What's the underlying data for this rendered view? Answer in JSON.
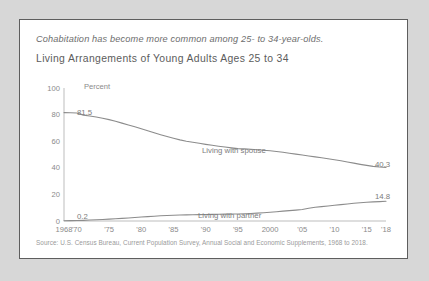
{
  "card": {
    "headline": "Cohabitation has become more common among 25- to 34-year-olds.",
    "title": "Living Arrangements of Young Adults Ages 25 to 34",
    "source": "Source: U.S. Census Bureau, Current Population Survey, Annual Social and Economic Supplements, 1968 to 2018."
  },
  "chart_data": {
    "type": "line",
    "title": "Living Arrangements of Young Adults Ages 25 to 34",
    "subtitle": "Cohabitation has become more common among 25- to 34-year-olds.",
    "xlabel": "",
    "ylabel": "Percent",
    "ylim": [
      0,
      100
    ],
    "yticks": [
      0,
      20,
      40,
      60,
      80,
      100
    ],
    "ytick_labels": [
      "0",
      "20",
      "40",
      "60",
      "80",
      "100"
    ],
    "xlim": [
      1968,
      2018
    ],
    "xticks": [
      1968,
      1970,
      1975,
      1980,
      1985,
      1990,
      1995,
      2000,
      2005,
      2010,
      2015,
      2018
    ],
    "xtick_labels": [
      "1968",
      "'70",
      "'75",
      "'80",
      "'85",
      "'90",
      "'95",
      "2000",
      "'05",
      "'10",
      "'15",
      "'18"
    ],
    "grid": false,
    "legend_position": "inline-annotations",
    "line_color": "#8c8c8c",
    "axis_color": "#b4b4b4",
    "annotations": [
      {
        "text": "81.5",
        "series": "Living with spouse",
        "x": 1968,
        "y": 81.5
      },
      {
        "text": "40.3",
        "series": "Living with spouse",
        "x": 2018,
        "y": 40.3
      },
      {
        "text": "0.2",
        "series": "Living with partner",
        "x": 1968,
        "y": 0.2
      },
      {
        "text": "14.8",
        "series": "Living with partner",
        "x": 2018,
        "y": 14.8
      },
      {
        "text": "Percent",
        "series": "",
        "x": 1968,
        "y": 100
      }
    ],
    "x": [
      1968,
      1969,
      1970,
      1971,
      1972,
      1973,
      1974,
      1975,
      1976,
      1977,
      1978,
      1979,
      1980,
      1981,
      1982,
      1983,
      1984,
      1985,
      1986,
      1987,
      1988,
      1989,
      1990,
      1991,
      1992,
      1993,
      1994,
      1995,
      1996,
      1997,
      1998,
      1999,
      2000,
      2001,
      2002,
      2003,
      2004,
      2005,
      2006,
      2007,
      2008,
      2009,
      2010,
      2011,
      2012,
      2013,
      2014,
      2015,
      2016,
      2017,
      2018
    ],
    "series": [
      {
        "name": "Living with spouse",
        "label": "Living with spouse",
        "start_value": 81.5,
        "end_value": 40.3,
        "values": [
          81.5,
          81.4,
          81.2,
          79.6,
          79.0,
          78.2,
          77.3,
          76.2,
          75.0,
          73.6,
          72.2,
          70.8,
          69.3,
          67.8,
          66.3,
          64.9,
          63.5,
          62.2,
          61.0,
          60.0,
          59.2,
          58.4,
          57.6,
          56.9,
          56.2,
          55.6,
          55.0,
          54.4,
          54.2,
          53.9,
          53.6,
          53.2,
          52.8,
          52.3,
          51.7,
          51.0,
          50.3,
          49.6,
          48.9,
          48.2,
          47.5,
          46.8,
          46.1,
          45.3,
          44.4,
          43.5,
          42.6,
          41.8,
          41.1,
          40.6,
          40.3
        ]
      },
      {
        "name": "Living with partner",
        "label": "Living with partner",
        "start_value": 0.2,
        "end_value": 14.8,
        "values": [
          0.2,
          0.3,
          0.4,
          0.5,
          0.7,
          0.9,
          1.1,
          1.4,
          1.7,
          2.0,
          2.3,
          2.6,
          3.0,
          3.3,
          3.6,
          3.9,
          4.1,
          4.3,
          4.5,
          4.6,
          4.7,
          4.8,
          4.9,
          5.0,
          5.1,
          5.2,
          5.3,
          5.3,
          5.4,
          5.6,
          5.9,
          6.2,
          6.6,
          7.0,
          7.4,
          7.8,
          8.2,
          8.6,
          9.6,
          10.3,
          10.8,
          11.3,
          11.8,
          12.3,
          12.8,
          13.3,
          13.7,
          14.1,
          14.4,
          14.6,
          14.8
        ]
      }
    ]
  }
}
